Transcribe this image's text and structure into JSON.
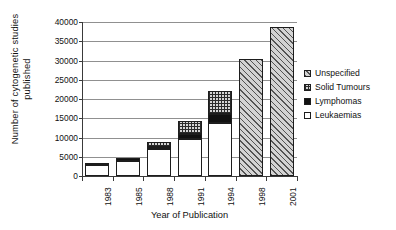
{
  "chart_data": {
    "type": "bar",
    "stacked": true,
    "title": "",
    "xlabel": "Year of Publication",
    "ylabel": "Number of cytogenetic studies published",
    "ylabel_lines": [
      "Number of cytogenetic studies",
      "published"
    ],
    "categories": [
      "1983",
      "1985",
      "1988",
      "1991",
      "1994",
      "1998",
      "2001"
    ],
    "ylim": [
      0,
      40000
    ],
    "ytick_values": [
      0,
      5000,
      10000,
      15000,
      20000,
      25000,
      30000,
      35000,
      40000
    ],
    "ytick_labels": [
      "0",
      "5000",
      "10000",
      "15000",
      "20000",
      "25000",
      "30000",
      "35000",
      "40000"
    ],
    "grid": true,
    "grid_axis": "y",
    "legend_position": "right",
    "series": [
      {
        "name": "Leukaemias",
        "fill": "white",
        "color": "#ffffff",
        "values": [
          2800,
          4000,
          7000,
          9500,
          13800,
          0,
          0
        ]
      },
      {
        "name": "Lymphomas",
        "fill": "solid-black",
        "color": "#111111",
        "values": [
          600,
          600,
          500,
          1300,
          2200,
          0,
          0
        ]
      },
      {
        "name": "Solid Tumours",
        "fill": "crosshatch",
        "color": "#d4d4d4",
        "values": [
          0,
          0,
          1300,
          3400,
          6000,
          0,
          0
        ]
      },
      {
        "name": "Unspecified",
        "fill": "diagonal-hatch",
        "color": "#9e9e9e",
        "values": [
          0,
          0,
          0,
          0,
          0,
          30400,
          38800
        ]
      }
    ],
    "totals": [
      3400,
      4600,
      8800,
      14200,
      22000,
      30400,
      38800
    ]
  },
  "legend": {
    "items": [
      {
        "label": "Unspecified",
        "swatch": "diagonal-hatch"
      },
      {
        "label": "Solid Tumours",
        "swatch": "crosshatch"
      },
      {
        "label": "Lymphomas",
        "swatch": "solid-black"
      },
      {
        "label": "Leukaemias",
        "swatch": "white"
      }
    ]
  },
  "colors": {
    "axis": "#3a3a3a",
    "grid": "#909090",
    "text": "#111111",
    "background": "#ffffff"
  }
}
